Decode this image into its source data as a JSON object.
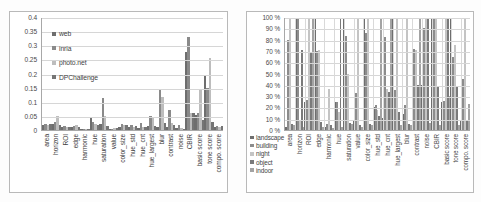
{
  "figure": {
    "background": "#fdfdfd",
    "panel_border": "#b9b9b9"
  },
  "chart_data": [
    {
      "id": "left",
      "type": "bar",
      "title": "",
      "xlabel": "",
      "ylabel": "",
      "ylim": [
        0,
        0.4
      ],
      "yticks": [
        "0",
        "0.05",
        "0.1",
        "0.15",
        "0.2",
        "0.25",
        "0.3",
        "0.35",
        "0.4"
      ],
      "ytick_values": [
        0,
        0.05,
        0.1,
        0.15,
        0.2,
        0.25,
        0.3,
        0.35,
        0.4
      ],
      "grid": true,
      "legend_position": "upper-left-inside",
      "categories": [
        "area",
        "horizon",
        "ROI",
        "edge",
        "harmonic",
        "hue",
        "saturation",
        "value",
        "color_size",
        "hue_std",
        "hue_cnt",
        "hue_largest",
        "blur",
        "contrast",
        "noise",
        "CBIR",
        "basic score",
        "tone score",
        "compo. score"
      ],
      "series": [
        {
          "name": "web",
          "color": "#6e6e6e",
          "values": [
            0.017,
            0.021,
            0.012,
            0.011,
            0.004,
            0.045,
            0.021,
            0.005,
            0.01,
            0.012,
            0.006,
            0.014,
            0.009,
            0.01,
            0.007,
            0.277,
            0.053,
            0.19,
            0.009
          ]
        },
        {
          "name": "inria",
          "color": "#8a8a8a",
          "values": [
            0.02,
            0.03,
            0.014,
            0.013,
            0.003,
            0.03,
            0.115,
            0.004,
            0.022,
            0.016,
            0.024,
            0.05,
            0.14,
            0.071,
            0.016,
            0.33,
            0.062,
            0.148,
            0.013
          ]
        },
        {
          "name": "photo.net",
          "color": "#bdbdbd",
          "values": [
            0.019,
            0.049,
            0.01,
            0.017,
            0.004,
            0.022,
            0.05,
            0.007,
            0.018,
            0.01,
            0.009,
            0.047,
            0.118,
            0.024,
            0.006,
            0.06,
            0.146,
            0.255,
            0.011
          ]
        },
        {
          "name": "DPChallenge",
          "color": "#757575",
          "values": [
            0.021,
            0.016,
            0.009,
            0.01,
            0.003,
            0.018,
            0.015,
            0.006,
            0.016,
            0.013,
            0.009,
            0.015,
            0.026,
            0.019,
            0.005,
            0.059,
            0.036,
            0.028,
            0.013
          ]
        }
      ]
    },
    {
      "id": "right",
      "type": "bar",
      "title": "",
      "xlabel": "",
      "ylabel": "",
      "ylim": [
        0,
        100
      ],
      "yticks": [
        "0 %",
        "10 %",
        "20 %",
        "30 %",
        "40 %",
        "50 %",
        "60 %",
        "70 %",
        "80 %",
        "90 %",
        "100 %"
      ],
      "ytick_values": [
        0,
        10,
        20,
        30,
        40,
        50,
        60,
        70,
        80,
        90,
        100
      ],
      "grid": true,
      "legend_position": "lower-left-outside",
      "categories": [
        "area",
        "horizon",
        "ROI",
        "edge",
        "harmonic",
        "hue",
        "saturation",
        "value",
        "color_size",
        "hue_std",
        "hue_cnt",
        "hue_largest",
        "blur",
        "contrast",
        "noise",
        "CBIR",
        "basic score",
        "tone score",
        "compo. score"
      ],
      "series": [
        {
          "name": "landscape",
          "color": "#6e6e6e",
          "values": [
            3,
            100,
            25,
            100,
            3,
            25,
            100,
            9,
            100,
            20,
            11,
            100,
            14,
            100,
            40,
            100,
            25,
            100,
            8
          ]
        },
        {
          "name": "building",
          "color": "#8c8c8c",
          "values": [
            80,
            100,
            27,
            70,
            5,
            25,
            83,
            33,
            86,
            22,
            82,
            35,
            22,
            72,
            90,
            100,
            26,
            65,
            45
          ]
        },
        {
          "name": "night",
          "color": "#c4c4c4",
          "values": [
            100,
            8,
            100,
            71,
            36,
            16,
            50,
            100,
            100,
            18,
            36,
            100,
            100,
            71,
            100,
            100,
            100,
            75,
            100
          ]
        },
        {
          "name": "object",
          "color": "#7a7a7a",
          "values": [
            5,
            71,
            68,
            7,
            4,
            100,
            6,
            4,
            5,
            12,
            34,
            16,
            5,
            40,
            100,
            38,
            100,
            38,
            9
          ]
        },
        {
          "name": "indoor",
          "color": "#a3a3a3",
          "values": [
            4,
            3,
            100,
            3,
            2,
            3,
            5,
            3,
            4,
            100,
            100,
            4,
            4,
            100,
            6,
            4,
            30,
            4,
            23
          ]
        }
      ]
    }
  ]
}
